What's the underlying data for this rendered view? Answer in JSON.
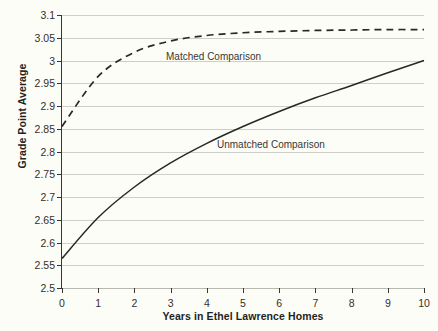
{
  "chart_data": {
    "type": "line",
    "title": "",
    "xlabel": "Years in Ethel Lawrence Homes",
    "ylabel": "Grade Point Average",
    "xlim": [
      0,
      10
    ],
    "ylim": [
      2.5,
      3.1
    ],
    "grid": true,
    "legend_position": "inline-annotation",
    "x_ticks": [
      "0",
      "1",
      "2",
      "3",
      "4",
      "5",
      "6",
      "7",
      "8",
      "9",
      "10"
    ],
    "y_ticks": [
      "2.5",
      "2.55",
      "2.6",
      "2.65",
      "2.7",
      "2.75",
      "2.8",
      "2.85",
      "2.9",
      "2.95",
      "3",
      "3.05",
      "3.1"
    ],
    "x": [
      0,
      1,
      2,
      3,
      4,
      5,
      6,
      7,
      8,
      9,
      10
    ],
    "series": [
      {
        "name": "Matched Comparison",
        "style": "dashed",
        "color": "#2b2723",
        "values": [
          2.855,
          2.965,
          3.018,
          3.043,
          3.055,
          3.061,
          3.064,
          3.066,
          3.067,
          3.068,
          3.068
        ]
      },
      {
        "name": "Unmatched Comparison",
        "style": "solid",
        "color": "#2b2723",
        "values": [
          2.565,
          2.655,
          2.722,
          2.775,
          2.818,
          2.855,
          2.888,
          2.918,
          2.945,
          2.973,
          3.0
        ]
      }
    ],
    "colors": {
      "background": "#fdfdf8",
      "gridline": "#cfcfc9",
      "axis": "#3a3530",
      "text": "#241f1c"
    }
  }
}
